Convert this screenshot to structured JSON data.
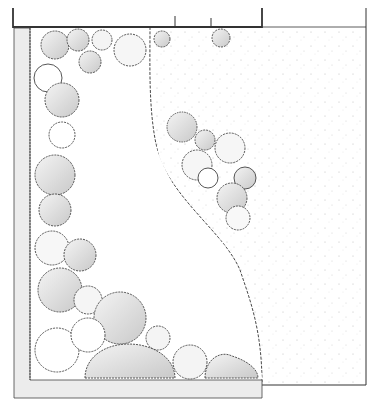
{
  "diagram": {
    "type": "garden-plan-sketch",
    "colors": {
      "background": "#ffffff",
      "outline": "#333333",
      "shrub_fill_light": "#f2f2f2",
      "shrub_fill_dark": "#cfcfcf",
      "gravel_dot": "#bdbdbd",
      "path_band": "#ececec"
    },
    "regions": [
      "boundary-fence",
      "border-path",
      "planting-bed",
      "lawn",
      "gravel-area",
      "island-shrub-group"
    ],
    "labels": []
  }
}
